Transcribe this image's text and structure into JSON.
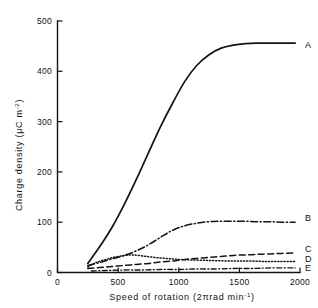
{
  "chart_data": {
    "type": "line",
    "title": "",
    "xlabel": "Speed of rotation (2πrad min⁻¹)",
    "ylabel": "Charge density (μC m⁻²)",
    "xlim": [
      0,
      2000
    ],
    "ylim": [
      0,
      500
    ],
    "xticks": [
      0,
      500,
      1000,
      1500,
      2000
    ],
    "yticks": [
      0,
      100,
      200,
      300,
      400,
      500
    ],
    "xtick_labels": [
      "0",
      "500",
      "1000",
      "1500",
      "2000"
    ],
    "ytick_labels": [
      "0",
      "100",
      "200",
      "300",
      "400",
      "500"
    ],
    "grid": false,
    "legend_position": "right-inline-labels",
    "series": [
      {
        "name": "A",
        "label": "A",
        "style": "solid",
        "x": [
          250,
          350,
          450,
          550,
          650,
          750,
          850,
          950,
          1050,
          1150,
          1250,
          1350,
          1450,
          1550,
          1650,
          1750,
          1850,
          1960
        ],
        "values": [
          18,
          52,
          90,
          135,
          185,
          238,
          290,
          337,
          380,
          412,
          433,
          446,
          452,
          455,
          456,
          456,
          456,
          456
        ]
      },
      {
        "name": "B",
        "label": "B",
        "style": "dash-dot",
        "x": [
          250,
          350,
          450,
          550,
          650,
          750,
          850,
          950,
          1050,
          1150,
          1250,
          1350,
          1450,
          1550,
          1650,
          1750,
          1850,
          1960
        ],
        "values": [
          14,
          20,
          27,
          34,
          43,
          55,
          70,
          84,
          93,
          98,
          101,
          102,
          102,
          102,
          101,
          101,
          100,
          100
        ]
      },
      {
        "name": "C",
        "label": "C",
        "style": "dashed",
        "x": [
          250,
          350,
          450,
          550,
          650,
          750,
          850,
          950,
          1050,
          1150,
          1250,
          1350,
          1450,
          1550,
          1650,
          1750,
          1850,
          1960
        ],
        "values": [
          8,
          10,
          12,
          14,
          16,
          18,
          21,
          23,
          26,
          28,
          30,
          32,
          34,
          35,
          36,
          37,
          38,
          39
        ]
      },
      {
        "name": "D",
        "label": "D",
        "style": "dotted",
        "x": [
          250,
          320,
          400,
          480,
          560,
          620,
          700,
          800,
          900,
          1000,
          1100,
          1250,
          1400,
          1550,
          1700,
          1850,
          1960
        ],
        "values": [
          11,
          20,
          26,
          31,
          34,
          35,
          33,
          30,
          28,
          26,
          25,
          24,
          23,
          23,
          22,
          22,
          22
        ]
      },
      {
        "name": "E",
        "label": "E",
        "style": "dash-dot",
        "x": [
          280,
          400,
          550,
          700,
          850,
          1000,
          1150,
          1300,
          1450,
          1600,
          1750,
          1960
        ],
        "values": [
          3,
          4,
          5,
          5,
          6,
          6,
          7,
          7,
          8,
          8,
          9,
          9
        ]
      }
    ]
  },
  "axis": {
    "x_title_main": "Speed of rotation (2",
    "x_title_pi": "π",
    "x_title_rad": "rad  min",
    "x_title_sup": "-1",
    "x_title_close": ")",
    "y_title_main": "Charge density (",
    "y_title_mu": "μ",
    "y_title_unit": "C  m",
    "y_title_sup": "-2",
    "y_title_close": ")"
  }
}
